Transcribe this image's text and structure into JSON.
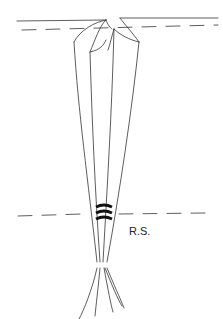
{
  "diagram": {
    "label": "R.S.",
    "stroke_color": "#333333"
  }
}
